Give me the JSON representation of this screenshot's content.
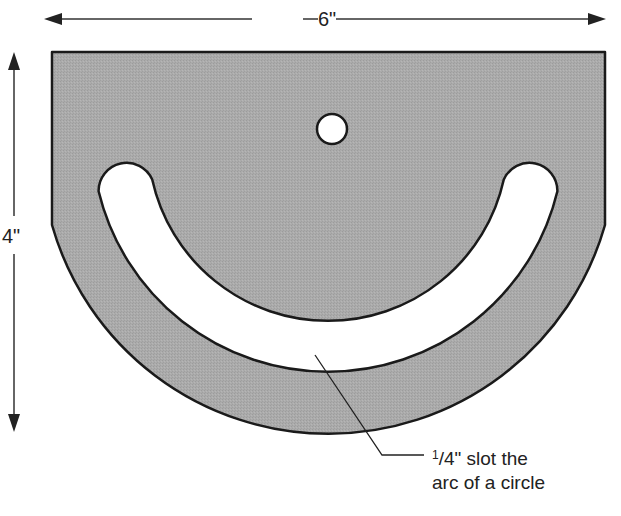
{
  "diagram": {
    "dimensions": {
      "width_label": "6\"",
      "height_label": "4\""
    },
    "callout": {
      "fraction_numerator": "1",
      "fraction_rest": "/4\" slot the",
      "line2": "arc of a circle"
    },
    "colors": {
      "plate_fill": "#a9a9a9",
      "outline": "#1a1a1a",
      "hole_fill": "#ffffff",
      "text": "#222222"
    },
    "parts": [
      "plate",
      "center-hole",
      "arc-slot",
      "width-dimension-arrow",
      "height-dimension-arrow",
      "leader-line"
    ]
  }
}
